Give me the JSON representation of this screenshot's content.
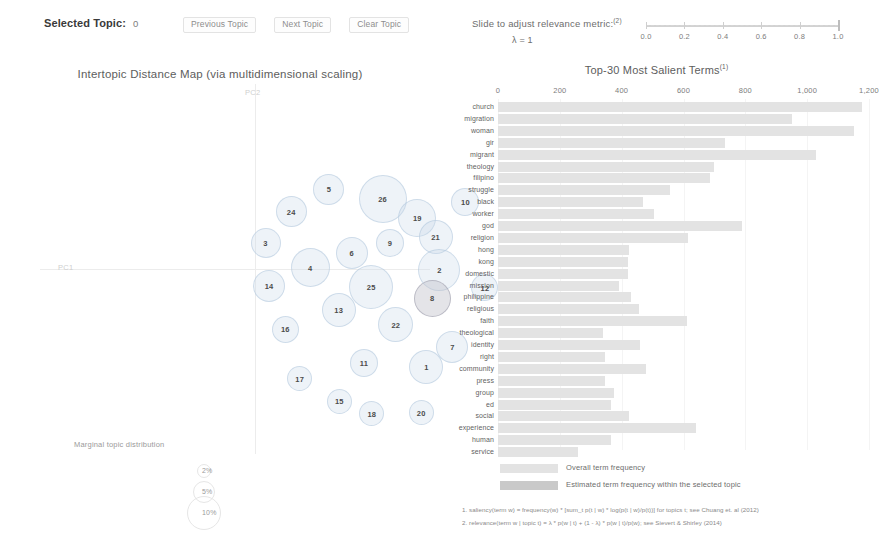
{
  "topic_controls": {
    "selected_topic_label": "Selected Topic:",
    "selected_topic_value": "0",
    "previous_topic_label": "Previous Topic",
    "next_topic_label": "Next Topic",
    "clear_topic_label": "Clear Topic"
  },
  "relevance": {
    "label": "Slide to adjust relevance metric:",
    "label_superscript": "(2)",
    "lambda_text": "λ = 1",
    "value": 1.0,
    "tick_labels": [
      "0.0",
      "0.2",
      "0.4",
      "0.6",
      "0.8",
      "1.0"
    ]
  },
  "map": {
    "title": "Intertopic Distance Map (via multidimensional scaling)",
    "x_axis_label": "PC1",
    "y_axis_label": "PC2",
    "marginal_title": "Marginal topic distribution",
    "marginal_labels": [
      "2%",
      "5%",
      "10%"
    ]
  },
  "bar_panel": {
    "title": "Top-30 Most Salient Terms",
    "title_superscript": "(1)",
    "legend_overall": "Overall term frequency",
    "legend_topic": "Estimated term frequency within the selected topic",
    "footnote1": "1. saliency(term w) = frequency(w) * [sum_t p(t | w) * log(p(t | w)/p(t))] for topics t; see Chuang et. al (2012)",
    "footnote2": "2. relevance(term w | topic t) = λ * p(w | t) + (1 - λ) * p(w | t)/p(w); see Sievert & Shirley (2014)"
  },
  "chart_data": [
    {
      "type": "scatter",
      "title": "Intertopic Distance Map (via multidimensional scaling)",
      "xlabel": "PC1",
      "ylabel": "PC2",
      "xlim": [
        -0.3,
        0.3
      ],
      "ylim": [
        -0.28,
        0.22
      ],
      "grid": false,
      "legend": "Marginal topic distribution",
      "points": [
        {
          "topic": "26",
          "x": 0.227,
          "y": 0.0645,
          "size": 48,
          "selected": false
        },
        {
          "topic": "5",
          "x": 0.1445,
          "y": 0.078,
          "size": 31,
          "selected": false
        },
        {
          "topic": "24",
          "x": 0.0865,
          "y": 0.0475,
          "size": 31,
          "selected": false
        },
        {
          "topic": "10",
          "x": 0.3545,
          "y": 0.0605,
          "size": 28,
          "selected": false
        },
        {
          "topic": "19",
          "x": 0.2805,
          "y": 0.0385,
          "size": 38,
          "selected": false
        },
        {
          "topic": "3",
          "x": 0.047,
          "y": 0.005,
          "size": 30,
          "selected": false
        },
        {
          "topic": "9",
          "x": 0.2385,
          "y": 0.005,
          "size": 28,
          "selected": false
        },
        {
          "topic": "21",
          "x": 0.3085,
          "y": 0.0135,
          "size": 34,
          "selected": false
        },
        {
          "topic": "6",
          "x": 0.1795,
          "y": -0.008,
          "size": 32,
          "selected": false
        },
        {
          "topic": "4",
          "x": 0.1155,
          "y": -0.028,
          "size": 39,
          "selected": false
        },
        {
          "topic": "2",
          "x": 0.3145,
          "y": -0.032,
          "size": 42,
          "selected": false
        },
        {
          "topic": "14",
          "x": 0.0525,
          "y": -0.0525,
          "size": 32,
          "selected": false
        },
        {
          "topic": "25",
          "x": 0.2095,
          "y": -0.0545,
          "size": 44,
          "selected": false
        },
        {
          "topic": "12",
          "x": 0.3845,
          "y": -0.0555,
          "size": 27,
          "selected": false
        },
        {
          "topic": "8",
          "x": 0.3035,
          "y": -0.0695,
          "size": 37,
          "selected": true
        },
        {
          "topic": "13",
          "x": 0.1595,
          "y": -0.086,
          "size": 34,
          "selected": false
        },
        {
          "topic": "22",
          "x": 0.2475,
          "y": -0.105,
          "size": 35,
          "selected": false
        },
        {
          "topic": "16",
          "x": 0.0775,
          "y": -0.1115,
          "size": 27,
          "selected": false
        },
        {
          "topic": "7",
          "x": 0.3345,
          "y": -0.135,
          "size": 32,
          "selected": false
        },
        {
          "topic": "11",
          "x": 0.1985,
          "y": -0.157,
          "size": 28,
          "selected": false
        },
        {
          "topic": "1",
          "x": 0.2945,
          "y": -0.162,
          "size": 34,
          "selected": false
        },
        {
          "topic": "17",
          "x": 0.0995,
          "y": -0.178,
          "size": 25,
          "selected": false
        },
        {
          "topic": "15",
          "x": 0.1605,
          "y": -0.2085,
          "size": 25,
          "selected": false
        },
        {
          "topic": "18",
          "x": 0.2105,
          "y": -0.2255,
          "size": 25,
          "selected": false
        },
        {
          "topic": "20",
          "x": 0.2865,
          "y": -0.2245,
          "size": 25,
          "selected": false
        }
      ]
    },
    {
      "type": "bar",
      "orientation": "horizontal",
      "title": "Top-30 Most Salient Terms",
      "xlabel": "",
      "ylabel": "",
      "xlim": [
        0,
        1200
      ],
      "xticks": [
        0,
        200,
        400,
        600,
        800,
        1000,
        1200
      ],
      "xtick_labels": [
        "0",
        "200",
        "400",
        "600",
        "800",
        "1,000",
        "1,200"
      ],
      "grid": true,
      "series": [
        {
          "name": "Overall term frequency",
          "color": "#e3e3e3"
        },
        {
          "name": "Estimated term frequency within the selected topic",
          "color": "#c9c9c9"
        }
      ],
      "categories": [
        "church",
        "migration",
        "woman",
        "gir",
        "migrant",
        "theology",
        "filipino",
        "struggle",
        "black",
        "worker",
        "god",
        "religion",
        "hong",
        "kong",
        "domestic",
        "mission",
        "philippine",
        "religious",
        "faith",
        "theological",
        "identity",
        "right",
        "community",
        "press",
        "group",
        "ed",
        "social",
        "experience",
        "human",
        "service"
      ],
      "values": [
        1177,
        950,
        1152,
        735,
        1030,
        700,
        685,
        555,
        470,
        505,
        790,
        615,
        425,
        420,
        420,
        390,
        430,
        455,
        610,
        340,
        460,
        345,
        480,
        345,
        375,
        365,
        425,
        640,
        365,
        260
      ]
    }
  ]
}
